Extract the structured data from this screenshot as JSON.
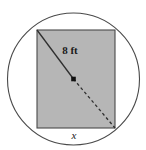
{
  "figure": {
    "background_color": "#ffffff",
    "stroke_color": "#3a3a3a",
    "rectangle": {
      "name": "inscribed-rectangle",
      "fill_color": "#b6b6b6",
      "stroke_color": "#4a4a4a",
      "x": 37,
      "y": 30,
      "width": 78,
      "height": 98
    },
    "circle": {
      "name": "circumscribed-circle",
      "fill_color": "none",
      "stroke_color": "#4a4a4a",
      "cx": 73.5,
      "cy": 79,
      "r": 66
    },
    "diagonal": {
      "name": "rectangle-diagonal",
      "label": "8 ft",
      "label_x": 70,
      "label_y": 54,
      "solid_from": [
        37,
        30
      ],
      "solid_to": [
        73.5,
        79
      ],
      "dashed_from": [
        73.5,
        79
      ],
      "dashed_to": [
        115,
        128
      ],
      "dash_pattern": "3,2.6",
      "stroke_color": "#2f2f2f"
    },
    "center_point": {
      "name": "circle-center-point",
      "cx": 73.5,
      "cy": 79,
      "size": 4.6,
      "color": "#111111"
    },
    "side_label": {
      "name": "bottom-side-label",
      "label": "x",
      "x": 74,
      "y": 139
    }
  }
}
